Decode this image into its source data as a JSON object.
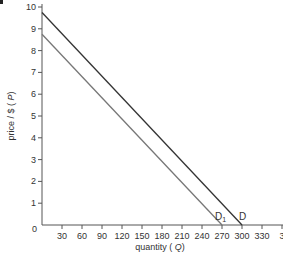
{
  "chart_data": {
    "type": "line",
    "title": "",
    "xlabel": "quantity (Q)",
    "ylabel": "price / $ (P)",
    "xlim": [
      0,
      345
    ],
    "ylim": [
      0,
      10
    ],
    "grid": false,
    "x_ticks": [
      "30",
      "60",
      "90",
      "120",
      "150",
      "180",
      "210",
      "240",
      "270",
      "300",
      "330",
      "3"
    ],
    "y_ticks": [
      "1",
      "2",
      "3",
      "4",
      "5",
      "6",
      "7",
      "8",
      "9",
      "10"
    ],
    "origin_label": "0",
    "series": [
      {
        "name": "D",
        "label": "D",
        "color": "#333333",
        "points": [
          [
            0,
            9.75
          ],
          [
            300,
            0
          ]
        ]
      },
      {
        "name": "D1",
        "label": "D",
        "subscript": "1",
        "color": "#777777",
        "points": [
          [
            0,
            8.75
          ],
          [
            270,
            0
          ]
        ]
      }
    ],
    "corner_mark": "a"
  }
}
